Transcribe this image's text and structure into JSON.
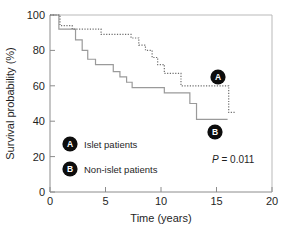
{
  "chart_data": {
    "type": "line",
    "title": "",
    "xlabel": "Time (years)",
    "ylabel": "Survival probability (%)",
    "xlim": [
      0,
      20
    ],
    "ylim": [
      0,
      100
    ],
    "xticks": [
      0,
      5,
      10,
      15,
      20
    ],
    "yticks": [
      0,
      20,
      40,
      60,
      80,
      100
    ],
    "xtick_labels": [
      "0",
      "5",
      "10",
      "15",
      "20"
    ],
    "ytick_labels": [
      "0",
      "20",
      "40",
      "60",
      "80",
      "100"
    ],
    "grid": false,
    "legend_position": "inside-lower-left",
    "style": "kaplan-meier step",
    "annotations": [
      {
        "id": "A",
        "text": "P = 0.011",
        "p_value": 0.011
      }
    ],
    "series": [
      {
        "name": "Islet patients",
        "marker_letter": "A",
        "linestyle": "dotted",
        "color": "#6e6e6e",
        "x": [
          0.0,
          0.9,
          0.9,
          2.0,
          2.0,
          4.6,
          4.6,
          7.3,
          7.3,
          8.0,
          8.0,
          8.6,
          8.6,
          9.2,
          9.2,
          9.7,
          9.7,
          10.3,
          10.3,
          11.8,
          11.8,
          16.1,
          16.1,
          16.7
        ],
        "y": [
          100,
          100,
          94,
          94,
          92,
          92,
          89,
          89,
          87,
          87,
          83,
          83,
          80,
          80,
          76,
          76,
          72,
          72,
          67,
          67,
          60,
          60,
          45,
          45
        ],
        "final_value": 45
      },
      {
        "name": "Non-islet patients",
        "marker_letter": "B",
        "linestyle": "solid",
        "color": "#9a9a9a",
        "x": [
          0.0,
          0.8,
          0.8,
          2.3,
          2.3,
          2.9,
          2.9,
          3.4,
          3.4,
          4.1,
          4.1,
          5.7,
          5.7,
          6.3,
          6.3,
          6.9,
          6.9,
          7.4,
          7.4,
          10.3,
          10.3,
          12.6,
          12.6,
          13.2,
          13.2,
          16.0
        ],
        "y": [
          100,
          100,
          92,
          92,
          86,
          86,
          80,
          80,
          75,
          75,
          72,
          72,
          68,
          68,
          65,
          65,
          62,
          62,
          59,
          59,
          56,
          56,
          50,
          50,
          41,
          41
        ],
        "final_value": 41
      }
    ]
  },
  "axes": {
    "y_title": "Survival probability (%)",
    "x_title": "Time (years)",
    "y_ticks": [
      {
        "value": 100,
        "label": "100"
      },
      {
        "value": 80,
        "label": "80"
      },
      {
        "value": 60,
        "label": "60"
      },
      {
        "value": 40,
        "label": "40"
      },
      {
        "value": 20,
        "label": "20"
      },
      {
        "value": 0,
        "label": "0"
      }
    ],
    "x_ticks": [
      {
        "value": 0,
        "label": "0"
      },
      {
        "value": 5,
        "label": "5"
      },
      {
        "value": 10,
        "label": "10"
      },
      {
        "value": 15,
        "label": "15"
      },
      {
        "value": 20,
        "label": "20"
      }
    ]
  },
  "legend": {
    "entries": [
      {
        "marker": "A",
        "label": "Islet patients"
      },
      {
        "marker": "B",
        "label": "Non-islet patients"
      }
    ]
  },
  "curve_markers": [
    {
      "marker": "A",
      "series": "Islet patients"
    },
    {
      "marker": "B",
      "series": "Non-islet patients"
    }
  ],
  "statistics": {
    "p_value_text": "P = 0.011",
    "p_symbol": "P",
    "p_rest": " = 0.011"
  },
  "colors": {
    "solid_curve": "#9a9a9a",
    "dotted_curve": "#6e6e6e",
    "axis": "#8c8c8c",
    "marker_fill": "#0d0d0d",
    "marker_text": "#ffffff",
    "background": "#ffffff",
    "text": "#1f1f1f"
  }
}
